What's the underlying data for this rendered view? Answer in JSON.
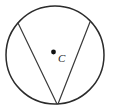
{
  "figure": {
    "background_color": "#ffffff",
    "stroke_color": "#2b2b2b",
    "chord_color": "#3a3a3a",
    "label_color": "#1a1a1a",
    "center_label": "C",
    "circle": {
      "cx": 55,
      "cy": 55,
      "r": 49
    },
    "center_point": {
      "cx": 53.5,
      "cy": 52,
      "r": 2.4
    },
    "label_position": {
      "x": 58,
      "y": 62
    },
    "vertex": {
      "x": 57,
      "y": 104
    },
    "chord_left_endpoint": {
      "x": 18,
      "y": 23
    },
    "chord_right_endpoint": {
      "x": 90,
      "y": 22
    }
  }
}
